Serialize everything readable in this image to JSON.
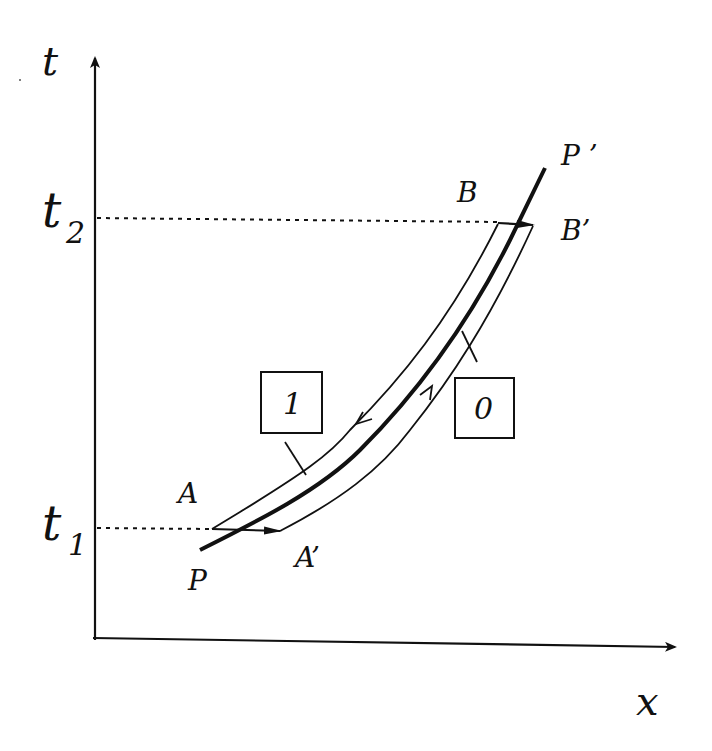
{
  "diagram": {
    "axes": {
      "vertical_label": "t",
      "horizontal_label": "x"
    },
    "time_marks": [
      {
        "main": "t",
        "sub": "2"
      },
      {
        "main": "t",
        "sub": "1"
      }
    ],
    "points": {
      "A": "A",
      "A_prime": "A’",
      "B": "B",
      "B_prime": "B’",
      "P": "P",
      "P_prime": "P ’"
    },
    "boxes": {
      "left_strip_edge": "1",
      "right_strip_edge": "0"
    },
    "colors": {
      "ink": "#111111",
      "background": "#ffffff"
    }
  }
}
